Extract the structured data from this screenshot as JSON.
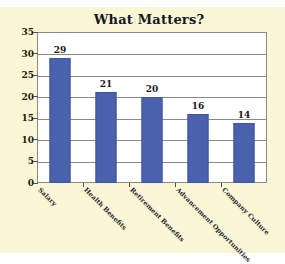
{
  "chart_data": {
    "type": "bar",
    "title": "What Matters?",
    "xlabel": "",
    "ylabel": "",
    "categories": [
      "Salary",
      "Health Benefits",
      "Retirement Benefits",
      "Advancement Opportunities",
      "Company Culture"
    ],
    "values": [
      29,
      21,
      20,
      16,
      14
    ],
    "ylim": [
      0,
      35
    ],
    "ytick_step": 5,
    "yticks": [
      35,
      30,
      25,
      20,
      15,
      10,
      5,
      0
    ],
    "ytick_labels": [
      "35",
      "30",
      "25",
      "20",
      "15",
      "10",
      "5",
      "0"
    ],
    "data_labels": [
      "29",
      "21",
      "20",
      "16",
      "14"
    ],
    "grid": "horizontal",
    "legend": "none",
    "bar_color": "#4A62AD",
    "plot_background": "#FFFFFF",
    "figure_background": "#FBF6D5",
    "axis_color": "#8A8A82",
    "text_color": "#1A1B21"
  }
}
